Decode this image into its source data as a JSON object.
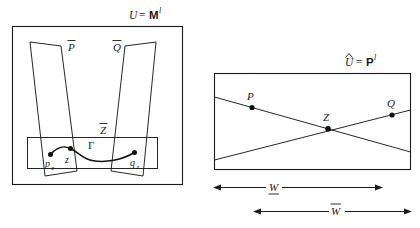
{
  "figure": {
    "background_color": "#ffffff",
    "ink_color": "#1a1a1a",
    "width": 420,
    "height": 228
  },
  "left_panel": {
    "name": "source-space-panel",
    "label": {
      "full": "U = Mₗ",
      "lhs": "U",
      "equals": "=",
      "rhs_symbol": "M",
      "rhs_superscript": "l"
    },
    "outer_box": {
      "x": 12,
      "y": 26,
      "width": 170,
      "height": 158
    },
    "shapes": [
      {
        "name": "slab-P-bar",
        "label": "P̄",
        "label_base": "P",
        "accent": "bar",
        "label_x": 72,
        "label_y": 48
      },
      {
        "name": "slab-Q-bar",
        "label": "Q̄",
        "label_base": "Q",
        "accent": "bar",
        "label_x": 117,
        "label_y": 48
      },
      {
        "name": "slab-Z-bar",
        "label": "Z̄",
        "label_base": "Z",
        "accent": "bar",
        "label_x": 103,
        "label_y": 131
      }
    ],
    "points": [
      {
        "name": "point-p-z",
        "label_base": "p",
        "subscript": "z",
        "label": "p₂",
        "x": 50,
        "y": 154
      },
      {
        "name": "point-z",
        "label_base": "z",
        "subscript": "",
        "label": "z",
        "x": 70,
        "y": 149
      },
      {
        "name": "point-q-z",
        "label_base": "q",
        "subscript": "z",
        "label": "q₂",
        "x": 135,
        "y": 152
      }
    ],
    "curve": {
      "name": "path-gamma",
      "label": "Γ",
      "label_x": 93,
      "label_y": 145
    }
  },
  "right_panel": {
    "name": "target-space-panel",
    "label": {
      "full": "Û = Pₗ",
      "lhs": "Û",
      "lhs_base": "U",
      "lhs_accent": "hat",
      "equals": "=",
      "rhs_symbol": "P",
      "rhs_superscript": "l"
    },
    "outer_box": {
      "x": 214,
      "y": 73,
      "width": 196,
      "height": 97
    },
    "points": [
      {
        "name": "point-P",
        "label": "P",
        "x": 252,
        "y": 106
      },
      {
        "name": "point-Z",
        "label": "Z",
        "x": 328,
        "y": 128
      },
      {
        "name": "point-Q",
        "label": "Q",
        "x": 392,
        "y": 115
      }
    ],
    "lines": [
      {
        "name": "line-P-descending",
        "from": "left-edge-upper",
        "to": "right-edge-lower"
      },
      {
        "name": "line-Q-ascending",
        "from": "left-edge-lower",
        "to": "right-edge-upper"
      }
    ]
  },
  "measurements": [
    {
      "name": "width-measure-inner",
      "label": "W",
      "label_base": "W",
      "accent": "underbar",
      "x_start": 213,
      "x_end": 382,
      "y": 187,
      "label_x": 271
    },
    {
      "name": "width-measure-outer",
      "label": "W̄",
      "label_base": "W",
      "accent": "overbar",
      "x_start": 253,
      "x_end": 412,
      "y": 211,
      "label_x": 333
    }
  ]
}
